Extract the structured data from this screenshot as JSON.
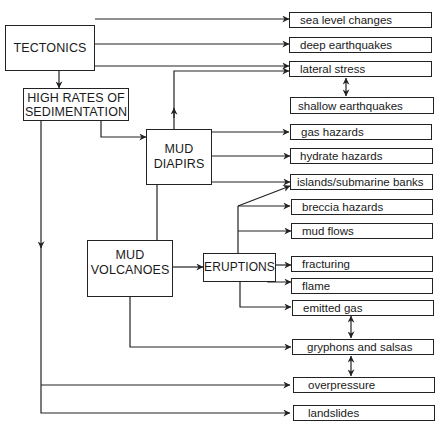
{
  "diagram": {
    "sources": {
      "tectonics": "TECTONICS",
      "sedimentation": "HIGH RATES OF SEDIMENTATION",
      "sedimentation_line1": "HIGH RATES OF",
      "sedimentation_line2": "SEDIMENTATION",
      "mud_diapirs_line1": "MUD",
      "mud_diapirs_line2": "DIAPIRS",
      "mud_volcanoes_line1": "MUD",
      "mud_volcanoes_line2": "VOLCANOES",
      "eruptions": "ERUPTIONS"
    },
    "outcomes": [
      {
        "id": "sea-level-changes",
        "label": "sea level changes"
      },
      {
        "id": "deep-earthquakes",
        "label": "deep earthquakes"
      },
      {
        "id": "lateral-stress",
        "label": "lateral stress"
      },
      {
        "id": "shallow-earthquakes",
        "label": "shallow earthquakes"
      },
      {
        "id": "gas-hazards",
        "label": "gas hazards"
      },
      {
        "id": "hydrate-hazards",
        "label": "hydrate hazards"
      },
      {
        "id": "islands-submarine-banks",
        "label": "islands/submarine banks"
      },
      {
        "id": "breccia-hazards",
        "label": "breccia hazards"
      },
      {
        "id": "mud-flows",
        "label": "mud flows"
      },
      {
        "id": "fracturing",
        "label": "fracturing"
      },
      {
        "id": "flame",
        "label": "flame"
      },
      {
        "id": "emitted-gas",
        "label": "emitted gas"
      },
      {
        "id": "gryphons-and-salsas",
        "label": "gryphons and salsas"
      },
      {
        "id": "overpressure",
        "label": "overpressure"
      },
      {
        "id": "landslides",
        "label": "landslides"
      }
    ],
    "edges": [
      {
        "from": "TECTONICS",
        "to": "sea level changes"
      },
      {
        "from": "TECTONICS",
        "to": "deep earthquakes"
      },
      {
        "from": "TECTONICS",
        "to": "lateral stress"
      },
      {
        "from": "TECTONICS",
        "to": "HIGH RATES OF SEDIMENTATION"
      },
      {
        "from": "HIGH RATES OF SEDIMENTATION",
        "to": "MUD DIAPIRS"
      },
      {
        "from": "HIGH RATES OF SEDIMENTATION",
        "to": "overpressure"
      },
      {
        "from": "HIGH RATES OF SEDIMENTATION",
        "to": "landslides"
      },
      {
        "from": "MUD DIAPIRS",
        "to": "lateral stress"
      },
      {
        "from": "MUD DIAPIRS",
        "to": "gas hazards"
      },
      {
        "from": "MUD DIAPIRS",
        "to": "hydrate hazards"
      },
      {
        "from": "MUD DIAPIRS",
        "to": "islands/submarine banks"
      },
      {
        "from": "MUD DIAPIRS",
        "to": "MUD VOLCANOES",
        "type": "line"
      },
      {
        "from": "MUD VOLCANOES",
        "to": "ERUPTIONS"
      },
      {
        "from": "MUD VOLCANOES",
        "to": "gryphons and salsas"
      },
      {
        "from": "ERUPTIONS",
        "to": "islands/submarine banks"
      },
      {
        "from": "ERUPTIONS",
        "to": "breccia hazards"
      },
      {
        "from": "ERUPTIONS",
        "to": "mud flows"
      },
      {
        "from": "ERUPTIONS",
        "to": "fracturing"
      },
      {
        "from": "ERUPTIONS",
        "to": "flame"
      },
      {
        "from": "ERUPTIONS",
        "to": "emitted gas"
      },
      {
        "from": "lateral stress",
        "to": "shallow earthquakes",
        "type": "bidirectional"
      },
      {
        "from": "emitted gas",
        "to": "gryphons and salsas",
        "type": "bidirectional"
      },
      {
        "from": "gryphons and salsas",
        "to": "overpressure",
        "type": "bidirectional"
      }
    ]
  }
}
